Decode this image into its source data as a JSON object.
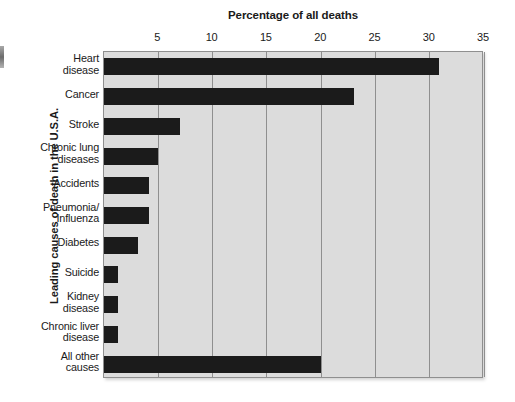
{
  "chart_data": {
    "type": "bar",
    "orientation": "horizontal",
    "title": "Percentage of all deaths",
    "xlabel": "Percentage of all deaths",
    "ylabel": "Leading causes of death in the U.S.A.",
    "xlim": [
      0,
      35
    ],
    "xticks": [
      5,
      10,
      15,
      20,
      25,
      30,
      35
    ],
    "xtick_labels": [
      "5",
      "10",
      "15",
      "20",
      "25",
      "30",
      "35"
    ],
    "grid": true,
    "legend": "none",
    "bar_color": "#1b1b1b",
    "plot_background": "#dcdcdc",
    "categories": [
      "Heart disease",
      "Cancer",
      "Stroke",
      "Chronic lung diseases",
      "Accidents",
      "Pneumonia/Influenza",
      "Diabetes",
      "Suicide",
      "Kidney disease",
      "Chronic liver disease",
      "All other causes"
    ],
    "category_lines": [
      [
        "Heart",
        "disease"
      ],
      [
        "Cancer"
      ],
      [
        "Stroke"
      ],
      [
        "Chronic lung",
        "diseases"
      ],
      [
        "Accidents"
      ],
      [
        "Pneumonia/",
        "Influenza"
      ],
      [
        "Diabetes"
      ],
      [
        "Suicide"
      ],
      [
        "Kidney",
        "disease"
      ],
      [
        "Chronic liver",
        "disease"
      ],
      [
        "All other",
        "causes"
      ]
    ],
    "values": [
      30.9,
      23.0,
      7.0,
      5.0,
      4.1,
      4.1,
      3.1,
      1.3,
      1.3,
      1.3,
      20.0
    ]
  }
}
